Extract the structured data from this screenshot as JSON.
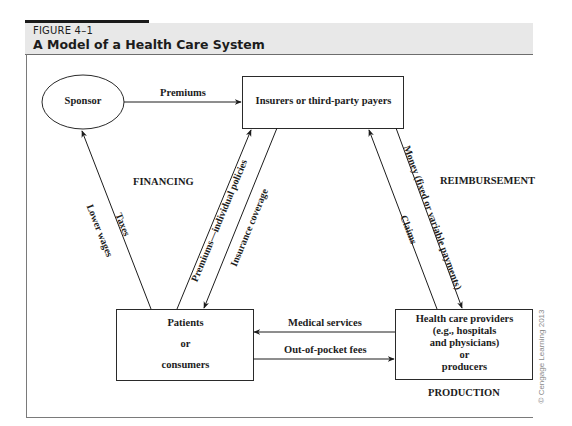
{
  "figure": {
    "number": "FIGURE 4–1",
    "title": "A Model of a Health Care System"
  },
  "nodes": {
    "sponsor": "Sponsor",
    "insurers": "Insurers or third-party payers",
    "patients": {
      "line1": "Patients",
      "line2": "or",
      "line3": "consumers"
    },
    "providers": {
      "line1": "Health care providers",
      "line2": "(e.g., hospitals",
      "line3": "and physicians)",
      "line4": "or",
      "line5": "producers"
    }
  },
  "edges": {
    "premiums": "Premiums",
    "taxes": "Taxes",
    "lower_wages": "Lower wages",
    "premiums_individual": "Premiums—individual policies",
    "insurance_coverage": "Insurance coverage",
    "money": "Money (fixed or variable payments)",
    "claims": "Claims",
    "medical_services": "Medical services",
    "out_of_pocket": "Out-of-pocket fees"
  },
  "regions": {
    "financing": "FINANCING",
    "reimbursement": "REIMBURSEMENT",
    "production": "PRODUCTION"
  },
  "credit": "© Cengage Learning 2013"
}
